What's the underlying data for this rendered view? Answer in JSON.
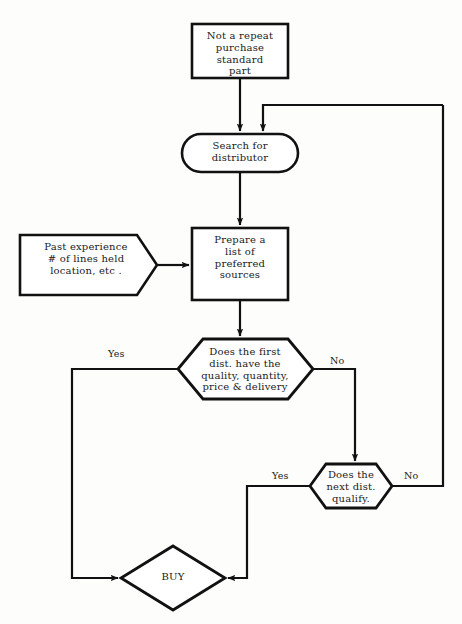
{
  "diagram": {
    "stroke_color": "#111111",
    "fill_color": "#ffffff",
    "background_color": "#fdfdfb",
    "nodes": {
      "start_box": {
        "shape": "rectangle",
        "text": "Not a repeat\npurchase\nstandard\npart"
      },
      "search_stadium": {
        "shape": "stadium",
        "text": "Search for\ndistributor"
      },
      "prepare_box": {
        "shape": "rectangle",
        "text": "Prepare a\nlist of\npreferred\nsources"
      },
      "past_experience": {
        "shape": "pentagon-input",
        "text": "Past experience\n# of lines held\nlocation, etc ."
      },
      "first_dist_decision": {
        "shape": "hexagon",
        "text": "Does the first\ndist. have the\nquality,  quantity,\nprice & delivery"
      },
      "next_dist_decision": {
        "shape": "hexagon",
        "text": "Does the\nnext dist.\nqualify."
      },
      "buy_diamond": {
        "shape": "diamond",
        "text": "BUY"
      }
    },
    "edge_labels": {
      "first_yes": "Yes",
      "first_no": "No",
      "next_yes": "Yes",
      "next_no": "No"
    }
  }
}
